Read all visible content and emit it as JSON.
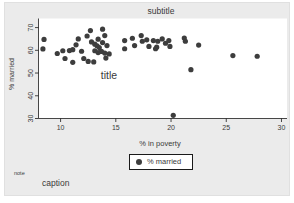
{
  "texts": {
    "subtitle": "subtitle",
    "title": "title",
    "note": "note",
    "caption": "caption"
  },
  "legend": {
    "label": "% married"
  },
  "colors": {
    "background": "#ebebeb",
    "plot_background": "#ffffff",
    "point": "#3d3d3d",
    "axis": "#1a1a1a",
    "text": "#3a3a3a",
    "legend_border": "#1a1a1a"
  },
  "chart_data": {
    "type": "scatter",
    "title": "title",
    "subtitle": "subtitle",
    "note": "note",
    "caption": "caption",
    "xlabel": "% in poverty",
    "ylabel": "% married",
    "xlim": [
      8,
      30.5
    ],
    "ylim": [
      30,
      74
    ],
    "xticks": [
      10,
      15,
      20,
      25,
      30
    ],
    "yticks": [
      30,
      40,
      50,
      60,
      70
    ],
    "grid": false,
    "legend_position": "bottom-center",
    "series_name": "% married",
    "points": [
      [
        8.5,
        64.8
      ],
      [
        8.4,
        60.6
      ],
      [
        9.7,
        58.6
      ],
      [
        10.2,
        59.8
      ],
      [
        10.4,
        56.4
      ],
      [
        10.8,
        59.9
      ],
      [
        11.1,
        60.3
      ],
      [
        11.1,
        54.7
      ],
      [
        11.4,
        62.4
      ],
      [
        11.6,
        65.0
      ],
      [
        11.9,
        59.6
      ],
      [
        12.1,
        56.4
      ],
      [
        12.4,
        66.3
      ],
      [
        12.7,
        68.7
      ],
      [
        12.8,
        63.7
      ],
      [
        12.5,
        55.1
      ],
      [
        13.0,
        54.9
      ],
      [
        13.1,
        62.7
      ],
      [
        13.1,
        59.8
      ],
      [
        13.4,
        64.9
      ],
      [
        13.3,
        62.0
      ],
      [
        13.5,
        61.2
      ],
      [
        13.8,
        63.4
      ],
      [
        14.0,
        66.5
      ],
      [
        13.8,
        69.3
      ],
      [
        14.2,
        62.1
      ],
      [
        13.7,
        59.5
      ],
      [
        13.4,
        59.0
      ],
      [
        14.0,
        58.8
      ],
      [
        14.4,
        58.4
      ],
      [
        14.1,
        56.6
      ],
      [
        15.8,
        64.3
      ],
      [
        15.8,
        60.7
      ],
      [
        16.5,
        65.3
      ],
      [
        16.7,
        62.1
      ],
      [
        17.3,
        66.5
      ],
      [
        17.4,
        64.0
      ],
      [
        17.8,
        64.6
      ],
      [
        18.0,
        61.7
      ],
      [
        18.4,
        64.3
      ],
      [
        18.7,
        61.4
      ],
      [
        18.8,
        64.0
      ],
      [
        18.6,
        60.7
      ],
      [
        19.2,
        65.0
      ],
      [
        19.5,
        63.1
      ],
      [
        19.8,
        64.3
      ],
      [
        19.9,
        61.7
      ],
      [
        21.2,
        65.4
      ],
      [
        21.3,
        64.0
      ],
      [
        21.8,
        51.5
      ],
      [
        22.5,
        62.3
      ],
      [
        25.6,
        57.7
      ],
      [
        27.8,
        57.4
      ],
      [
        20.2,
        31.4
      ]
    ]
  }
}
